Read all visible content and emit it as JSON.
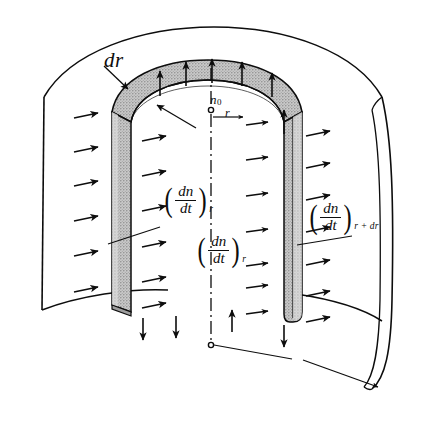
{
  "figure": {
    "background_color": "#ffffff",
    "line_color": "#0d0d0d",
    "shell_fill_color": "#bdbdbd",
    "shell_fill_highlight": "#d8d8d8"
  },
  "labels": {
    "dr": {
      "text": "dr",
      "meaning": "shell-thickness"
    },
    "n0": {
      "base": "n",
      "subscript": "0",
      "meaning": "concentration-at-axis"
    },
    "r_radius": {
      "text": "r",
      "meaning": "radial-coordinate"
    },
    "flux_inner_1": {
      "numerator": "dn",
      "denominator": "dt",
      "subscript": "r",
      "left_paren": "(",
      "right_paren": ")",
      "meaning": "flux-at-radius-r"
    },
    "flux_inner_2": {
      "numerator": "dn",
      "denominator": "dt",
      "subscript": "r",
      "left_paren": "(",
      "right_paren": ")",
      "meaning": "flux-at-radius-r-lower"
    },
    "flux_outer": {
      "numerator": "dn",
      "denominator": "dt",
      "subscript": "r + dr",
      "left_paren": "(",
      "right_paren": ")",
      "meaning": "flux-at-radius-r-plus-dr"
    }
  },
  "geometry": {
    "arrow_counts": {
      "outer_left_inward": 6,
      "shell_left_inner": 6,
      "shell_right_inner": 7,
      "outer_right_outward": 7,
      "top_ring_up": 5,
      "bottom_down": 4
    },
    "axis_style": "dash-dot",
    "axis_marker": "open-circle"
  }
}
